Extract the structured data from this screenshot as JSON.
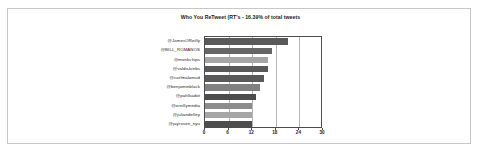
{
  "chart_data": {
    "type": "bar",
    "orientation": "horizontal",
    "title": "Who You ReTweet (RT's - 16.39% of total tweets",
    "xlabel": "",
    "ylabel": "",
    "xlim": [
      0,
      30
    ],
    "xticks": [
      0,
      6,
      12,
      18,
      24,
      30
    ],
    "grid": true,
    "legend": "none",
    "categories": [
      "@JamesOReilly",
      "@BILL_ROMANOS",
      "@monkchips",
      "@valdiskrebs",
      "@carlmalamud",
      "@benjaminblack",
      "@pahlkadot",
      "@oreillymedia",
      "@juliandelley",
      "@jayrosen_nyu"
    ],
    "values": [
      21,
      17,
      16,
      16,
      15,
      14,
      13,
      12,
      12,
      12
    ],
    "bar_colors": [
      "#595959",
      "#666666",
      "#a6a6a6",
      "#595959",
      "#595959",
      "#808080",
      "#4d4d4d",
      "#8c8c8c",
      "#a6a6a6",
      "#4d4d4d"
    ]
  },
  "chart": {
    "axis_color": "#4d4d4d",
    "gridline_color": "#b5b5b5",
    "frame_color": "#c8c8c8",
    "background": "#ffffff"
  }
}
